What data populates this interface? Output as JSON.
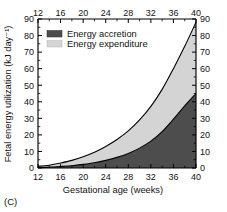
{
  "figure": {
    "panel_label": "(C)"
  },
  "chart_data": {
    "type": "area",
    "title": "",
    "xlabel": "Gestational age (weeks)",
    "ylabel": "Fetal energy utilization (kJ day⁻¹)",
    "xlim": [
      12,
      40
    ],
    "ylim": [
      0,
      90
    ],
    "grid": false,
    "stacked": true,
    "legend_position": "top-left",
    "x_ticks": [
      12,
      16,
      20,
      24,
      28,
      32,
      36,
      40
    ],
    "x_tick_labels": [
      "12",
      "16",
      "20",
      "24",
      "28",
      "32",
      "36",
      "40"
    ],
    "x_minor_ticks": [
      14,
      18,
      22,
      26,
      30,
      34,
      38
    ],
    "y_ticks": [
      0,
      10,
      20,
      30,
      40,
      50,
      60,
      70,
      80,
      90
    ],
    "y_tick_labels": [
      "0",
      "10",
      "20",
      "30",
      "40",
      "50",
      "60",
      "70",
      "80",
      "90"
    ],
    "y_minor_ticks": [
      5,
      15,
      25,
      35,
      45,
      55,
      65,
      75,
      85
    ],
    "axes": {
      "top_axis": true,
      "right_axis": true,
      "right_tick_labels": [
        "0",
        "10",
        "20",
        "30",
        "40",
        "50",
        "60",
        "70",
        "80",
        "90"
      ],
      "top_tick_labels": [
        "12",
        "16",
        "20",
        "24",
        "28",
        "32",
        "36",
        "40"
      ]
    },
    "x": [
      12,
      14,
      16,
      18,
      20,
      22,
      24,
      26,
      28,
      30,
      32,
      34,
      36,
      38,
      40
    ],
    "series": [
      {
        "name": "Energy accretion",
        "color": "#4d4d4d",
        "values": [
          0.3,
          0.5,
          0.9,
          1.4,
          2.2,
          3.2,
          4.6,
          6.4,
          8.8,
          12.0,
          16.2,
          22.0,
          29.5,
          37.5,
          45.0
        ]
      },
      {
        "name": "Energy expenditure",
        "color": "#d4d4d4",
        "values": [
          0.7,
          1.2,
          2.1,
          3.2,
          4.6,
          6.3,
          8.4,
          10.8,
          13.6,
          17.0,
          21.0,
          25.5,
          30.5,
          36.0,
          43.0
        ]
      }
    ],
    "totals": [
      1.0,
      1.7,
      3.0,
      4.6,
      6.8,
      9.5,
      13.0,
      17.2,
      22.4,
      29.0,
      37.2,
      47.5,
      60.0,
      73.5,
      88.0
    ],
    "legend": [
      {
        "label": "Energy accretion",
        "color": "#4d4d4d"
      },
      {
        "label": "Energy expenditure",
        "color": "#d4d4d4"
      }
    ]
  }
}
